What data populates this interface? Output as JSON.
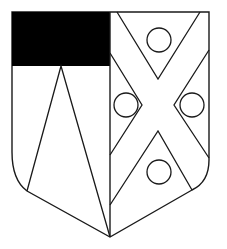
{
  "figure": {
    "type": "heraldic-shield",
    "width": 227,
    "height": 249,
    "colors": {
      "background": "#ffffff",
      "field": "#ffffff",
      "line": "#1a1a1a",
      "canton": "#000000"
    },
    "dexter": {
      "description": "canton sable with a pile issuing to base",
      "canton": {
        "x": 12,
        "y": 12,
        "w": 98,
        "h": 54
      },
      "pile": {
        "apex": [
          61,
          66
        ],
        "left": [
          27,
          191
        ],
        "right": [
          110,
          237
        ]
      }
    },
    "sinister": {
      "description": "saltire with four roundels in the spaces",
      "roundels": [
        {
          "cx": 159,
          "cy": 40,
          "r": 12
        },
        {
          "cx": 126,
          "cy": 105,
          "r": 12
        },
        {
          "cx": 192,
          "cy": 105,
          "r": 12
        },
        {
          "cx": 159,
          "cy": 172,
          "r": 12
        }
      ]
    }
  }
}
